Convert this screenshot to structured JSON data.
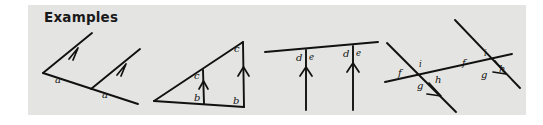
{
  "panel": {
    "background_color": "#e4e4e2",
    "page_background_color": "#ffffff",
    "ink_color": "#111111"
  },
  "heading": {
    "text": "Examples"
  },
  "figures": [
    {
      "id": "fig-1",
      "name": "two-parallel-rays-on-transversal",
      "description": "A transversal line with two parallel arrowed rays; corresponding angles both labeled a",
      "labels": [
        "a",
        "a"
      ],
      "arrow_marks": 1
    },
    {
      "id": "fig-2",
      "name": "triangle-with-parallel-verticals",
      "description": "A triangle with an interior vertical segment parallel to the right side; angles labeled c at the top and b at the bottom of each vertical",
      "labels": [
        "c",
        "b",
        "c",
        "b"
      ],
      "arrow_marks": 1
    },
    {
      "id": "fig-3",
      "name": "two-parallel-verticals-meeting-a-line",
      "description": "A slanted line crossed by two parallel vertical arrowed rays; angles labeled d on the left and e on the right at each meeting point",
      "labels": [
        "d",
        "e",
        "d",
        "e"
      ],
      "arrow_marks": 1
    },
    {
      "id": "fig-4",
      "name": "two-parallel-transversal-crossings",
      "description": "A line crossed by two parallel arrowed lines forming two identical sets of four angles labeled f, i, g, h",
      "labels": [
        "f",
        "i",
        "g",
        "h",
        "f",
        "i",
        "g",
        "h"
      ],
      "arrow_marks": 1
    }
  ],
  "label_text": {
    "a": "a",
    "b": "b",
    "c": "c",
    "d": "d",
    "e": "e",
    "f": "f",
    "g": "g",
    "h": "h",
    "i": "i"
  }
}
